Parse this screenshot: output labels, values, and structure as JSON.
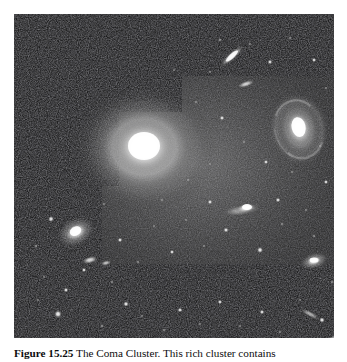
{
  "figure": {
    "label": "Figure 15.25",
    "caption_text": "The Coma Cluster. This rich cluster contains",
    "full_caption": "Figure 15.25 The Coma Cluster. This rich cluster contains",
    "alt": "Negative-style astronomical photograph of a rich galaxy cluster showing a large bright elliptical galaxy at center within a lighter rectangular inset, a barred spiral galaxy at upper right, a second elliptical galaxy at lower left, and many faint background galaxies and point sources on a dark sky.",
    "background_color": "#0b0b0b",
    "page_color": "#ffffff",
    "caption_color": "#0d0d0d"
  },
  "plate": {
    "name": "coma-cluster-plate",
    "width": 320,
    "height": 324,
    "inset": {
      "name": "exposure-inset",
      "description": "Brighter stepped rectangular sub-exposure region surrounding the central elliptical galaxy",
      "brightness_label": "lighter exposure",
      "corner_x": 105,
      "corner_y": 98
    },
    "objects": [
      {
        "name": "central-elliptical-galaxy",
        "type": "elliptical",
        "cx": 130,
        "cy": 134,
        "rx": 46,
        "ry": 40,
        "brightness": 1.0
      },
      {
        "name": "barred-spiral-galaxy",
        "type": "spiral",
        "cx": 285,
        "cy": 115,
        "rx": 26,
        "ry": 32,
        "brightness": 0.85
      },
      {
        "name": "lower-left-elliptical-galaxy",
        "type": "elliptical",
        "cx": 62,
        "cy": 218,
        "rx": 15,
        "ry": 11,
        "brightness": 0.72
      },
      {
        "name": "edge-on-galaxy-upper",
        "type": "edge-on",
        "cx": 218,
        "cy": 42,
        "rx": 14,
        "ry": 4,
        "brightness": 0.7
      },
      {
        "name": "edge-on-galaxy-mid",
        "type": "edge-on",
        "cx": 228,
        "cy": 195,
        "rx": 16,
        "ry": 6,
        "brightness": 0.75
      },
      {
        "name": "elliptical-galaxy-right-lower",
        "type": "elliptical",
        "cx": 300,
        "cy": 247,
        "rx": 13,
        "ry": 8,
        "brightness": 0.78
      }
    ]
  }
}
